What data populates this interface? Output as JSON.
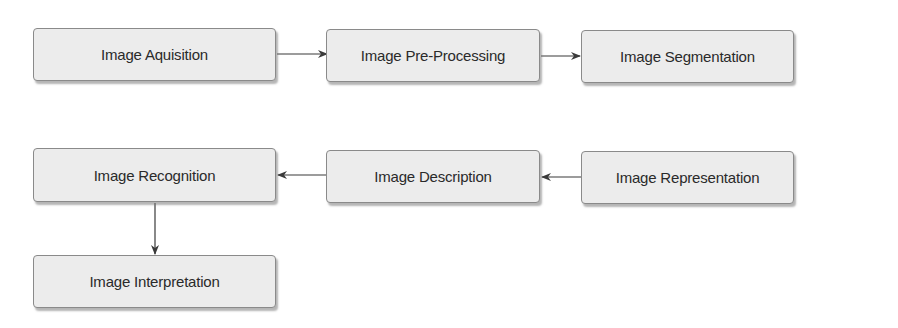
{
  "diagram": {
    "type": "flowchart",
    "nodes": [
      {
        "id": "n1",
        "label": "Image Aquisition"
      },
      {
        "id": "n2",
        "label": "Image Pre-Processing"
      },
      {
        "id": "n3",
        "label": "Image Segmentation"
      },
      {
        "id": "n4",
        "label": "Image Recognition"
      },
      {
        "id": "n5",
        "label": "Image Description"
      },
      {
        "id": "n6",
        "label": "Image Representation"
      },
      {
        "id": "n7",
        "label": "Image Interpretation"
      }
    ],
    "edges": [
      {
        "from": "n1",
        "to": "n2"
      },
      {
        "from": "n2",
        "to": "n3"
      },
      {
        "from": "n6",
        "to": "n5"
      },
      {
        "from": "n5",
        "to": "n4"
      },
      {
        "from": "n4",
        "to": "n7"
      }
    ],
    "colors": {
      "box_fill": "#ececec",
      "box_border": "#8a8a8a",
      "arrow": "#3a3a3a",
      "text": "#2a2a2a"
    }
  }
}
